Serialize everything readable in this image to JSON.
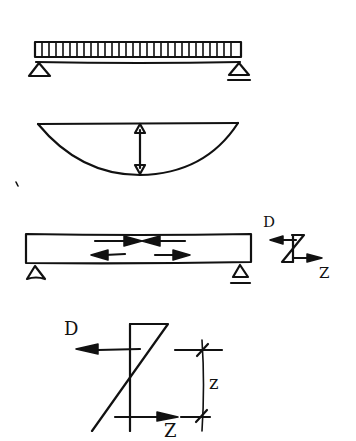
{
  "diagram": {
    "title": "",
    "panels": [
      {
        "id": "loaded-beam",
        "description": "Simply supported beam under uniformly distributed load"
      },
      {
        "id": "moment-diagram",
        "description": "Parabolic bending moment diagram with max moment arrow"
      },
      {
        "id": "beam-internal-forces",
        "description": "Beam with compression (top) and tension (bottom) arrows"
      },
      {
        "id": "section-stress-small",
        "description": "Small section stress distribution with D and Z resultants"
      },
      {
        "id": "section-stress-large",
        "description": "Enlarged stress distribution with D, Z and lever arm z"
      }
    ],
    "labels": {
      "small_compression": "D",
      "small_tension": "Z",
      "large_compression": "D",
      "large_tension": "Z",
      "lever_arm": "z"
    },
    "colors": {
      "ink": "#111111",
      "background": "#ffffff"
    }
  }
}
